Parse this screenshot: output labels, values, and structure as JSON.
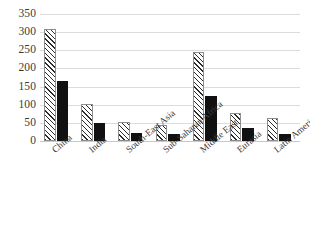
{
  "chart_data": {
    "type": "bar",
    "title": "",
    "xlabel": "",
    "ylabel": "",
    "ylim": [
      0,
      350
    ],
    "grid": true,
    "legend": "none",
    "categories": [
      "China",
      "India",
      "South-East Asia",
      "Sub-Saharan Africa",
      "Middle East",
      "Eurasia",
      "Latin America"
    ],
    "ytick_labels": [
      "0",
      "50",
      "100",
      "150",
      "200",
      "250",
      "300",
      "350"
    ],
    "ytick_values": [
      0,
      50,
      100,
      150,
      200,
      250,
      300,
      350
    ],
    "series": [
      {
        "name": "hatched",
        "style": "diagonal-hatch",
        "values": [
          310,
          101,
          53,
          45,
          244,
          78,
          64
        ]
      },
      {
        "name": "solid",
        "style": "solid-black",
        "values": [
          165,
          50,
          21,
          20,
          125,
          37,
          19
        ]
      }
    ]
  }
}
